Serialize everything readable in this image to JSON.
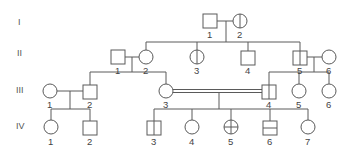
{
  "generations": [
    "I",
    "II",
    "III",
    "IV"
  ],
  "individuals": {
    "I": [
      {
        "id": "1",
        "sex": "male",
        "marking": "none"
      },
      {
        "id": "2",
        "sex": "female",
        "marking": "vertical-line"
      }
    ],
    "II": [
      {
        "id": "1",
        "sex": "male",
        "marking": "none"
      },
      {
        "id": "2",
        "sex": "female",
        "marking": "none"
      },
      {
        "id": "3",
        "sex": "female",
        "marking": "vertical-line"
      },
      {
        "id": "4",
        "sex": "male",
        "marking": "none"
      },
      {
        "id": "5",
        "sex": "male",
        "marking": "vertical-line"
      },
      {
        "id": "6",
        "sex": "female",
        "marking": "none"
      }
    ],
    "III": [
      {
        "id": "1",
        "sex": "female",
        "marking": "none"
      },
      {
        "id": "2",
        "sex": "male",
        "marking": "none"
      },
      {
        "id": "3",
        "sex": "female",
        "marking": "none"
      },
      {
        "id": "4",
        "sex": "male",
        "marking": "vertical-line"
      },
      {
        "id": "5",
        "sex": "female",
        "marking": "none"
      },
      {
        "id": "6",
        "sex": "female",
        "marking": "none"
      }
    ],
    "IV": [
      {
        "id": "1",
        "sex": "female",
        "marking": "none"
      },
      {
        "id": "2",
        "sex": "male",
        "marking": "none"
      },
      {
        "id": "3",
        "sex": "male",
        "marking": "vertical-line"
      },
      {
        "id": "4",
        "sex": "female",
        "marking": "none"
      },
      {
        "id": "5",
        "sex": "female",
        "marking": "cross"
      },
      {
        "id": "6",
        "sex": "male",
        "marking": "horizontal-line"
      },
      {
        "id": "7",
        "sex": "female",
        "marking": "none"
      }
    ]
  },
  "relationships": [
    {
      "partners": [
        "I-1",
        "I-2"
      ],
      "type": "mating",
      "children": [
        "II-2",
        "II-3",
        "II-4",
        "II-5"
      ]
    },
    {
      "partners": [
        "II-1",
        "II-2"
      ],
      "type": "mating",
      "children": [
        "III-2",
        "III-3"
      ]
    },
    {
      "partners": [
        "II-5",
        "II-6"
      ],
      "type": "mating",
      "children": [
        "III-4",
        "III-5",
        "III-6"
      ]
    },
    {
      "partners": [
        "III-1",
        "III-2"
      ],
      "type": "mating",
      "children": [
        "IV-1",
        "IV-2"
      ]
    },
    {
      "partners": [
        "III-3",
        "III-4"
      ],
      "type": "consanguineous",
      "children": [
        "IV-3",
        "IV-4",
        "IV-5",
        "IV-6",
        "IV-7"
      ]
    }
  ]
}
